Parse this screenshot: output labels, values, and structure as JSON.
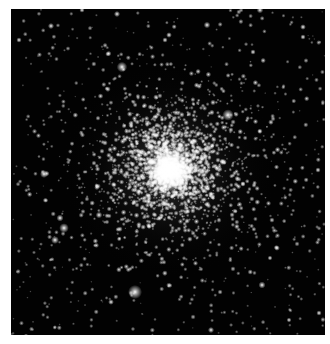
{
  "image": {
    "subject": "globular star cluster",
    "description": "Dense spherical cluster of stars on black sky with bright white core",
    "frame": {
      "x": 11,
      "y": 9,
      "width": 314,
      "height": 326
    },
    "background_color": "#ffffff",
    "sky_color": "#020202"
  },
  "cluster": {
    "core_center": {
      "x": 170,
      "y": 170
    },
    "core_radius": 22,
    "halo_radius": 110,
    "core_color": "#ffffff"
  },
  "bright_stars": [
    {
      "x": 135,
      "y": 292,
      "r": 3.2
    },
    {
      "x": 228,
      "y": 115,
      "r": 2.6
    },
    {
      "x": 122,
      "y": 67,
      "r": 2.4
    },
    {
      "x": 64,
      "y": 228,
      "r": 2.2
    },
    {
      "x": 44,
      "y": 174,
      "r": 1.8
    },
    {
      "x": 55,
      "y": 240,
      "r": 1.8
    },
    {
      "x": 60,
      "y": 218,
      "r": 1.6
    },
    {
      "x": 262,
      "y": 285,
      "r": 1.6
    },
    {
      "x": 99,
      "y": 215,
      "r": 1.5
    },
    {
      "x": 260,
      "y": 10,
      "r": 1.5
    },
    {
      "x": 117,
      "y": 14,
      "r": 1.4
    },
    {
      "x": 207,
      "y": 25,
      "r": 1.5
    },
    {
      "x": 51,
      "y": 26,
      "r": 1.4
    },
    {
      "x": 303,
      "y": 27,
      "r": 1.3
    },
    {
      "x": 82,
      "y": 10,
      "r": 1.2
    },
    {
      "x": 253,
      "y": 52,
      "r": 1.2
    },
    {
      "x": 303,
      "y": 37,
      "r": 1.2
    },
    {
      "x": 19,
      "y": 40,
      "r": 1.2
    },
    {
      "x": 169,
      "y": 35,
      "r": 1.3
    },
    {
      "x": 165,
      "y": 40,
      "r": 1.2
    },
    {
      "x": 26,
      "y": 336,
      "r": 1.1
    },
    {
      "x": 111,
      "y": 302,
      "r": 1.3
    },
    {
      "x": 211,
      "y": 330,
      "r": 1.4
    },
    {
      "x": 319,
      "y": 313,
      "r": 1.2
    },
    {
      "x": 289,
      "y": 320,
      "r": 1.1
    },
    {
      "x": 277,
      "y": 248,
      "r": 1.3
    },
    {
      "x": 318,
      "y": 170,
      "r": 1.2
    },
    {
      "x": 270,
      "y": 258,
      "r": 1.1
    }
  ],
  "field": {
    "seed": 42,
    "background_star_count": 650,
    "cluster_star_count": 2600
  }
}
